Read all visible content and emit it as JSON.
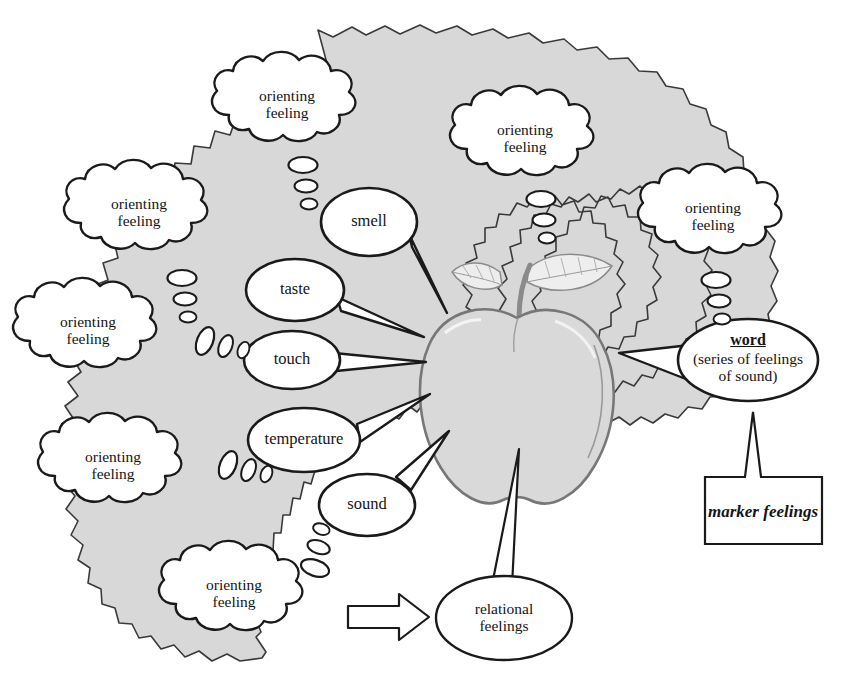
{
  "diagram": {
    "background_color": "#ffffff",
    "blob_fill": "#d8d8d8",
    "stroke_color": "#1a1a1a",
    "apple_fill": "#d9d9d9"
  },
  "orienting_feelings": [
    {
      "label": "orienting\nfeeling",
      "x": 287,
      "y": 109
    },
    {
      "label": "orienting\nfeeling",
      "x": 525,
      "y": 143
    },
    {
      "label": "orienting\nfeeling",
      "x": 139,
      "y": 217
    },
    {
      "label": "orienting\nfeeling",
      "x": 713,
      "y": 221
    },
    {
      "label": "orienting\nfeeling",
      "x": 88,
      "y": 335
    },
    {
      "label": "orienting\nfeeling",
      "x": 113,
      "y": 470
    },
    {
      "label": "orienting\nfeeling",
      "x": 234,
      "y": 598
    }
  ],
  "sense_bubbles": [
    {
      "label": "smell",
      "x": 369,
      "y": 222
    },
    {
      "label": "taste",
      "x": 295,
      "y": 290
    },
    {
      "label": "touch",
      "x": 292,
      "y": 360
    },
    {
      "label": "temperature",
      "x": 304,
      "y": 440
    },
    {
      "label": "sound",
      "x": 367,
      "y": 505
    }
  ],
  "word_bubble": {
    "main_label": "word",
    "sub_label": "(series of feelings\nof sound)",
    "x": 748,
    "y": 360
  },
  "marker_box": {
    "label": "marker feelings",
    "x": 763,
    "y": 512
  },
  "relational_bubble": {
    "label": "relational\nfeelings",
    "x": 504,
    "y": 618
  },
  "apple": {
    "name": "apple",
    "x": 517,
    "y": 388
  },
  "arrow": {
    "name": "block-arrow-right",
    "x": 390,
    "y": 617
  }
}
